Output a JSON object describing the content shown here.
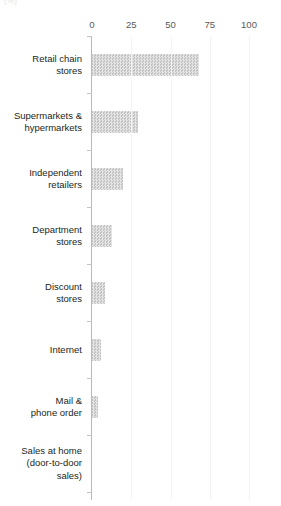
{
  "unit_label": "(%)",
  "chart_data": {
    "type": "bar",
    "orientation": "horizontal",
    "title": "",
    "subtitle": "",
    "xlabel": "(%)",
    "ylabel": "",
    "xlim": [
      0,
      100
    ],
    "xticks": [
      0,
      25,
      50,
      75,
      100
    ],
    "xtick_labels": [
      "0",
      "25",
      "50",
      "75",
      "100"
    ],
    "grid": true,
    "grid_axis": "x",
    "legend": false,
    "legend_position": "none",
    "bar_color": "#c3c3c3",
    "bar_pattern": "fine-checker-hatch",
    "categories": [
      "Retail chain\nstores",
      "Supermarkets &\nhypermarkets",
      "Independent\nretailers",
      "Department\nstores",
      "Discount\nstores",
      "Internet",
      "Mail &\nphone order",
      "Sales at home\n(door-to-door\nsales)"
    ],
    "values": [
      68,
      29,
      20,
      13,
      8,
      6,
      4,
      0
    ]
  }
}
